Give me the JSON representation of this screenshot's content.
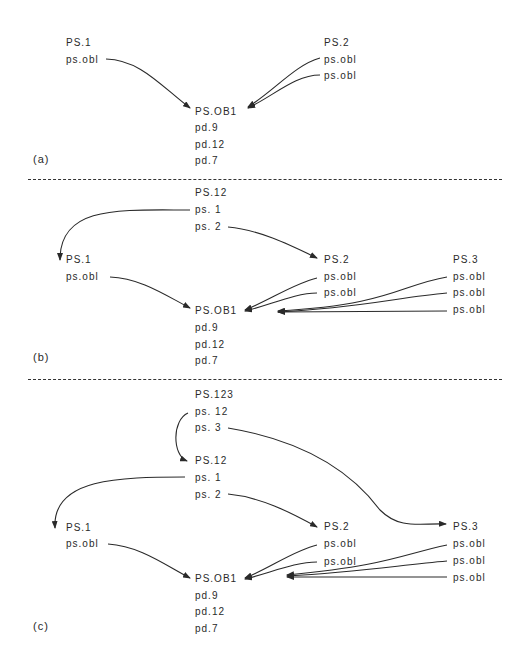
{
  "panels": [
    {
      "tag": "(a)",
      "nodes": {
        "ps1": {
          "title": "PS.1",
          "items": [
            "ps.obl"
          ]
        },
        "ps2": {
          "title": "PS.2",
          "items": [
            "ps.obl",
            "ps.obl"
          ]
        },
        "psob1": {
          "title": "PS.OB1",
          "items": [
            "pd.9",
            "pd.12",
            "pd.7"
          ]
        }
      }
    },
    {
      "tag": "(b)",
      "nodes": {
        "ps12": {
          "title": "PS.12",
          "items": [
            "ps. 1",
            "ps. 2"
          ]
        },
        "ps1": {
          "title": "PS.1",
          "items": [
            "ps.obl"
          ]
        },
        "ps2": {
          "title": "PS.2",
          "items": [
            "ps.obl",
            "ps.obl"
          ]
        },
        "ps3": {
          "title": "PS.3",
          "items": [
            "ps.obl",
            "ps.obl",
            "ps.obl"
          ]
        },
        "psob1": {
          "title": "PS.OB1",
          "items": [
            "pd.9",
            "pd.12",
            "pd.7"
          ]
        }
      }
    },
    {
      "tag": "(c)",
      "nodes": {
        "ps123": {
          "title": "PS.123",
          "items": [
            "ps. 12",
            "ps. 3"
          ]
        },
        "ps12": {
          "title": "PS.12",
          "items": [
            "ps. 1",
            "ps. 2"
          ]
        },
        "ps1": {
          "title": "PS.1",
          "items": [
            "ps.obl"
          ]
        },
        "ps2": {
          "title": "PS.2",
          "items": [
            "ps.obl",
            "ps.obl"
          ]
        },
        "ps3": {
          "title": "PS.3",
          "items": [
            "ps.obl",
            "ps.obl",
            "ps.obl"
          ]
        },
        "psob1": {
          "title": "PS.OB1",
          "items": [
            "pd.9",
            "pd.12",
            "pd.7"
          ]
        }
      }
    }
  ],
  "colors": {
    "ink": "#2a2a2a",
    "background": "#ffffff"
  }
}
